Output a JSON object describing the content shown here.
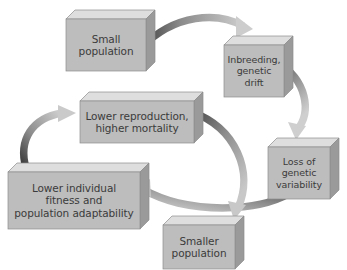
{
  "figure": {
    "kind": "cycle-diagram",
    "clipped_title": "Figure 2  The extinction vortex in small populations",
    "background_color": "#ffffff",
    "box_front_color": "#bdbdbd",
    "box_top_color": "#dedede",
    "box_side_color": "#9a9a9a",
    "box_outline_color": "#8d8d8d",
    "text_color": "#3b3b3b",
    "arrow_dark_color": "#4f4f4f",
    "arrow_light_color": "#c9c9c9"
  },
  "nodes": [
    {
      "id": "small-population",
      "label": "Small\npopulation",
      "font_size": 10.5,
      "x": 66,
      "y": 10,
      "w": 80,
      "h": 52,
      "depth": 9
    },
    {
      "id": "inbreeding-genetic-drift",
      "label": "Inbreeding,\ngenetic\ndrift",
      "font_size": 9.5,
      "x": 224,
      "y": 36,
      "w": 60,
      "h": 52,
      "depth": 9
    },
    {
      "id": "loss-of-genetic-variability",
      "label": "Loss of\ngenetic\nvariability",
      "font_size": 9.5,
      "x": 268,
      "y": 138,
      "w": 62,
      "h": 52,
      "depth": 9
    },
    {
      "id": "smaller-population",
      "label": "Smaller\npopulation",
      "font_size": 10.5,
      "x": 163,
      "y": 216,
      "w": 72,
      "h": 44,
      "depth": 9
    },
    {
      "id": "lower-individual-fitness",
      "label": "Lower individual\nfitness and\npopulation adaptability",
      "font_size": 10.5,
      "x": 8,
      "y": 163,
      "w": 132,
      "h": 57,
      "depth": 9
    },
    {
      "id": "lower-reproduction-higher-mortality",
      "label": "Lower reproduction,\nhigher mortality",
      "font_size": 10.5,
      "x": 80,
      "y": 92,
      "w": 114,
      "h": 42,
      "depth": 9
    }
  ],
  "arrows": [
    {
      "id": "arrow-small-to-inbreeding",
      "from": "small-population",
      "to": "inbreeding-genetic-drift"
    },
    {
      "id": "arrow-inbreeding-to-loss",
      "from": "inbreeding-genetic-drift",
      "to": "loss-of-genetic-variability"
    },
    {
      "id": "arrow-loss-to-lower-fitness",
      "from": "loss-of-genetic-variability",
      "to": "lower-individual-fitness"
    },
    {
      "id": "arrow-lower-fitness-to-lower-repro",
      "from": "lower-individual-fitness",
      "to": "lower-reproduction-higher-mortality"
    },
    {
      "id": "arrow-lower-repro-to-smaller",
      "from": "lower-reproduction-higher-mortality",
      "to": "smaller-population"
    }
  ]
}
